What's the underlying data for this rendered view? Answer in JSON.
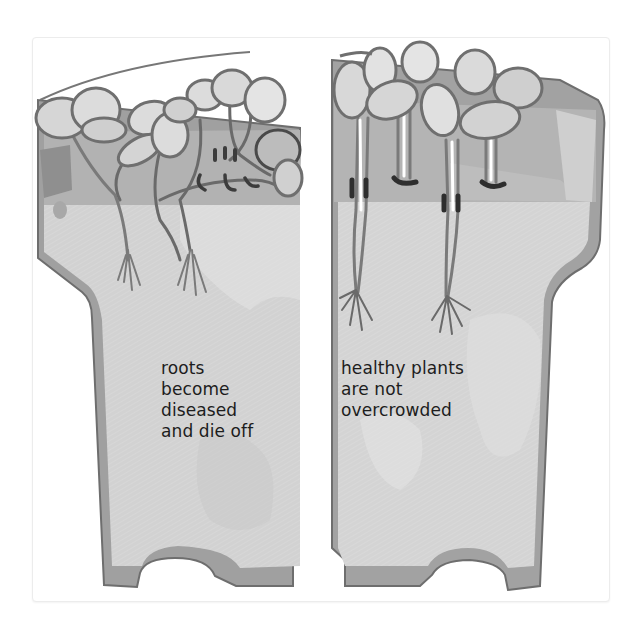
{
  "illustration": {
    "subject": "two half plant pots with seedlings",
    "left_panel": {
      "state": "overcrowded seedlings",
      "caption_lines": [
        "roots",
        "become",
        "diseased",
        "and die off"
      ]
    },
    "right_panel": {
      "state": "spaced seedlings",
      "caption_lines": [
        "healthy plants",
        "are not",
        "overcrowded"
      ]
    },
    "colors": {
      "background": "#ffffff",
      "pot_rim": "#8e8e8e",
      "pot_rim_inner": "#b4b4b4",
      "soil": "#d3d3d3",
      "soil_top": "#a9a9a9",
      "leaf_outline": "#6f6f6f",
      "leaf_fill": "#dedede",
      "text": "#1d1d1d"
    }
  }
}
